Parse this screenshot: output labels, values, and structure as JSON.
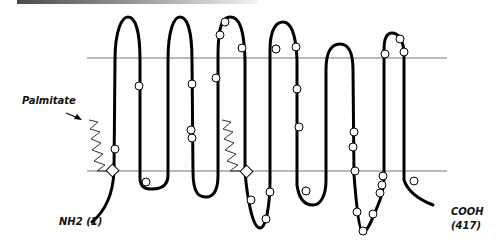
{
  "diagram": {
    "type": "membrane-protein-topology",
    "labels": {
      "palmitate": "Palmitate",
      "n_terminus": "NH2 (1)",
      "c_terminus_line1": "COOH",
      "c_terminus_line2": "(417)"
    },
    "membrane": {
      "top_y": 58,
      "bottom_y": 171,
      "x_start": 87,
      "x_end": 447
    },
    "transmembrane_segments": 7,
    "markers": {
      "circles": 31,
      "diamonds": 2,
      "palmitate_zigzags": 2
    },
    "colors": {
      "line": "#000000",
      "membrane": "#777777",
      "marker_fill": "#ffffff"
    }
  }
}
